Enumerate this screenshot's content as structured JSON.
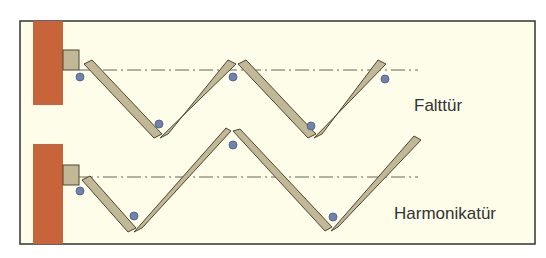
{
  "diagram": {
    "colors": {
      "background": "#fefde9",
      "frame": "#333333",
      "wall": "#c8643a",
      "panel": "#c3b896",
      "panel_stroke": "#4a4535",
      "hinge": "#6f83ad",
      "axis": "#6a6558"
    },
    "labels": {
      "top": "Falttür",
      "bottom": "Harmonikatür"
    }
  }
}
